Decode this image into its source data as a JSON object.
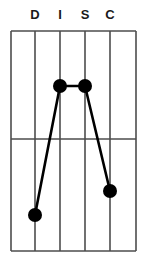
{
  "chart_data": {
    "type": "line",
    "title": "",
    "subtitle": "",
    "xlabel": "",
    "ylabel": "",
    "categories": [
      "D",
      "I",
      "S",
      "C"
    ],
    "series": [
      {
        "name": "DISC Profile",
        "values": [
          1.7,
          7.5,
          7.5,
          2.7
        ]
      }
    ],
    "ylim": [
      0,
      10
    ],
    "xlim": [
      0,
      5
    ],
    "grid": true,
    "grid_vertical_count": 6,
    "grid_horizontal_midline": true,
    "legend": "none",
    "marker": "filled-circle",
    "line_color": "#000000",
    "marker_color": "#000000",
    "grid_color": "#4d4d4d",
    "background_color": "#ffffff",
    "points": [
      {
        "label": "D",
        "x_px": 35,
        "y_px": 215
      },
      {
        "label": "I",
        "x_px": 60,
        "y_px": 86
      },
      {
        "label": "S",
        "x_px": 85,
        "y_px": 86
      },
      {
        "label": "C",
        "x_px": 110,
        "y_px": 191
      }
    ],
    "geometry": {
      "plot_left_px": 11,
      "plot_right_px": 136,
      "plot_top_px": 31,
      "plot_bottom_px": 251,
      "vertical_line_x_px": [
        11,
        35,
        60,
        85,
        110,
        136
      ],
      "horizontal_line_y_px": [
        31,
        139,
        251
      ],
      "marker_radius_px": 7
    }
  },
  "axis": {
    "labels": [
      {
        "text": "D",
        "x_px": 35
      },
      {
        "text": "I",
        "x_px": 60
      },
      {
        "text": "S",
        "x_px": 85
      },
      {
        "text": "C",
        "x_px": 110
      }
    ]
  }
}
